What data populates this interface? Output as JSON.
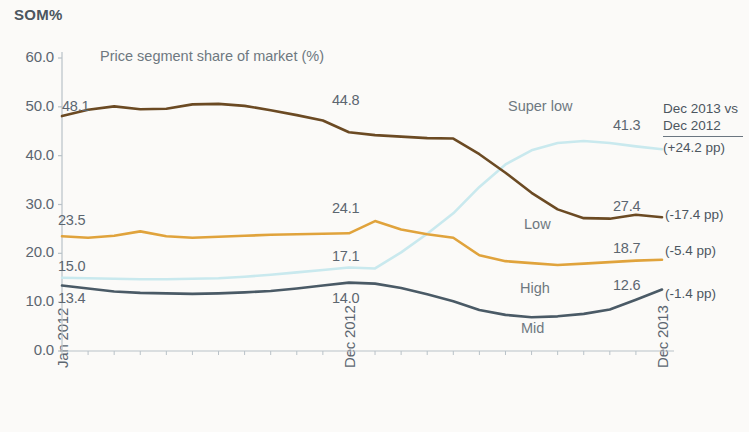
{
  "header": {
    "som_label": "SOM%"
  },
  "chart_data": {
    "type": "line",
    "title": "Price segment share of market (%)",
    "xlabel": "",
    "ylabel": "SOM%",
    "ylim": [
      0,
      60
    ],
    "yticks": [
      "0.0",
      "10.0",
      "20.0",
      "30.0",
      "40.0",
      "50.0",
      "60.0"
    ],
    "ytick_values": [
      0,
      10,
      20,
      30,
      40,
      50,
      60
    ],
    "grid": false,
    "legend": "inline-series-labels",
    "xtick_labels": [
      "Jan 2012",
      "Dec 2012",
      "Dec 2013"
    ],
    "xtick_indices": [
      0,
      11,
      23
    ],
    "x": [
      "Jan 2012",
      "Feb 2012",
      "Mar 2012",
      "Apr 2012",
      "May 2012",
      "Jun 2012",
      "Jul 2012",
      "Aug 2012",
      "Sep 2012",
      "Oct 2012",
      "Nov 2012",
      "Dec 2012",
      "Jan 2013",
      "Feb 2013",
      "Mar 2013",
      "Apr 2013",
      "May 2013",
      "Jun 2013",
      "Jul 2013",
      "Aug 2013",
      "Sep 2013",
      "Oct 2013",
      "Nov 2013",
      "Dec 2013"
    ],
    "series": [
      {
        "name": "Low",
        "color": "#6B4A23",
        "label_position": "mid-upper",
        "values": [
          48.1,
          49.4,
          50.1,
          49.5,
          49.6,
          50.5,
          50.6,
          50.2,
          49.3,
          48.3,
          47.2,
          44.8,
          44.2,
          43.9,
          43.6,
          43.5,
          40.3,
          36.5,
          32.4,
          29.0,
          27.2,
          27.1,
          27.9,
          27.4
        ],
        "start_label": "48.1",
        "mid_label": "44.8",
        "end_label": "27.4",
        "delta": "(-17.4 pp)"
      },
      {
        "name": "High",
        "color": "#E0A33C",
        "label_position": "mid",
        "values": [
          23.5,
          23.2,
          23.6,
          24.5,
          23.5,
          23.2,
          23.4,
          23.6,
          23.8,
          23.9,
          24.0,
          24.1,
          26.6,
          24.9,
          23.9,
          23.2,
          19.6,
          18.4,
          18.0,
          17.6,
          17.9,
          18.2,
          18.5,
          18.7
        ],
        "start_label": "23.5",
        "mid_label": "24.1",
        "end_label": "18.7",
        "delta": "(-5.4 pp)"
      },
      {
        "name": "Super low",
        "color": "#C9E9EE",
        "label_position": "upper-right",
        "values": [
          15.0,
          14.9,
          14.8,
          14.7,
          14.7,
          14.8,
          14.9,
          15.2,
          15.6,
          16.1,
          16.6,
          17.1,
          16.9,
          20.2,
          24.0,
          28.2,
          33.6,
          38.2,
          41.1,
          42.6,
          43.0,
          42.6,
          41.9,
          41.3
        ],
        "start_label": "15.0",
        "mid_label": "17.1",
        "end_label": "41.3",
        "delta": "(+24.2 pp)"
      },
      {
        "name": "Mid",
        "color": "#4A5A66",
        "label_position": "lower",
        "values": [
          13.4,
          12.8,
          12.2,
          11.9,
          11.8,
          11.7,
          11.8,
          12.0,
          12.3,
          12.8,
          13.4,
          14.0,
          13.8,
          12.9,
          11.6,
          10.2,
          8.4,
          7.4,
          6.9,
          7.1,
          7.6,
          8.5,
          10.5,
          12.6
        ],
        "start_label": "13.4",
        "mid_label": "14.0",
        "end_label": "12.6",
        "delta": "(-1.4 pp)"
      }
    ],
    "comparison_box": {
      "line1": "Dec 2013 vs",
      "line2": "Dec 2012",
      "line3": "(+24.2 pp)"
    },
    "axis_color": "#b9c2c8",
    "text_color": "#5c6670"
  }
}
